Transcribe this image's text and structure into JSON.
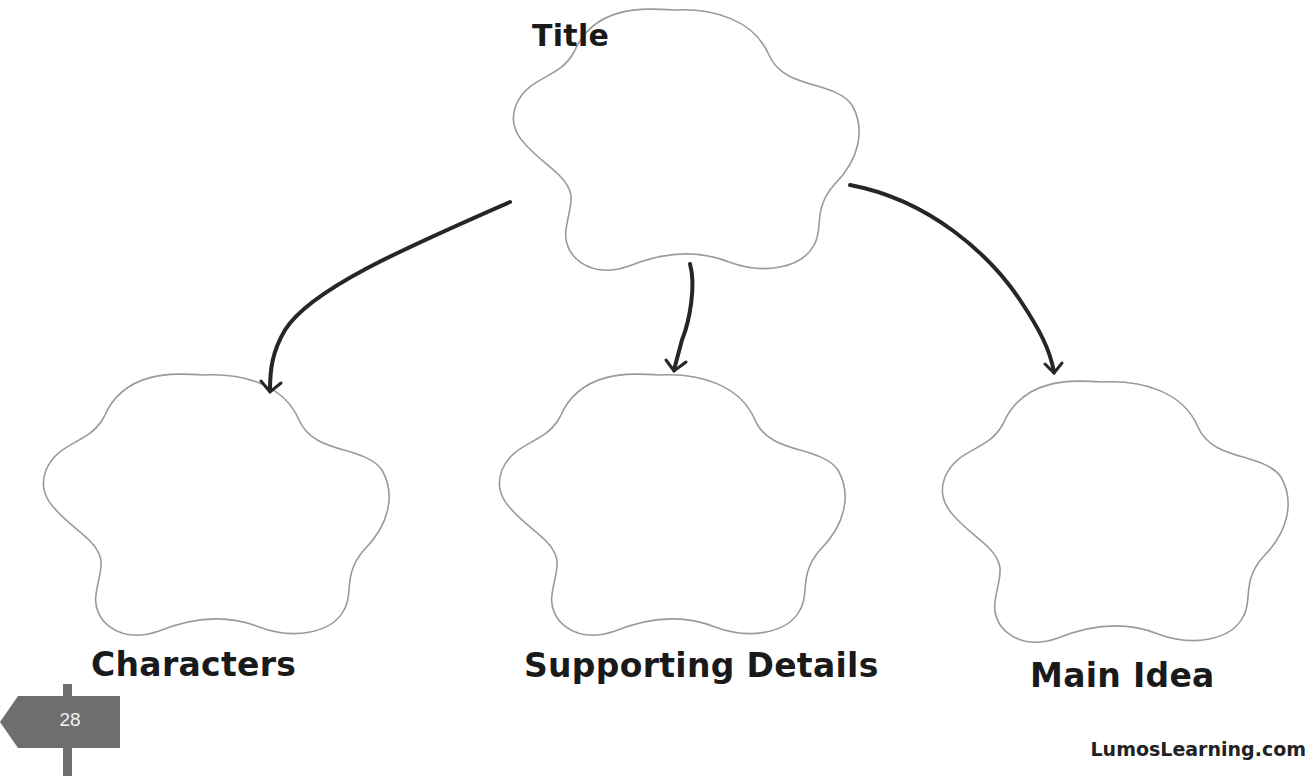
{
  "diagram": {
    "type": "graphic-organizer",
    "nodes": [
      {
        "id": "title",
        "label": "Title",
        "shape": "flower",
        "role": "root"
      },
      {
        "id": "characters",
        "label": "Characters",
        "shape": "flower",
        "role": "child"
      },
      {
        "id": "supporting_details",
        "label": "Supporting Details",
        "shape": "flower",
        "role": "child"
      },
      {
        "id": "main_idea",
        "label": "Main Idea",
        "shape": "flower",
        "role": "child"
      }
    ],
    "edges": [
      {
        "from": "title",
        "to": "characters"
      },
      {
        "from": "title",
        "to": "supporting_details"
      },
      {
        "from": "title",
        "to": "main_idea"
      }
    ]
  },
  "labels": {
    "title": "Title",
    "characters": "Characters",
    "supporting_details": "Supporting Details",
    "main_idea": "Main Idea"
  },
  "footer": {
    "page_number": "28",
    "brand": "LumosLearning.com"
  },
  "colors": {
    "outline": "#9a9a9a",
    "arrow": "#262626",
    "signpost": "#6e6e6e",
    "text": "#1a1a1a"
  }
}
